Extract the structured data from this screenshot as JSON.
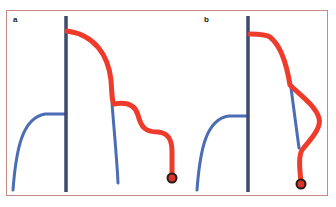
{
  "figure": {
    "panels": [
      {
        "label": "a",
        "description": "Main trunk with side branch; red trajectory descends past blue branch via S-curve to terminal endpoint"
      },
      {
        "label": "b",
        "description": "Main trunk with side branch; red trajectory bulges outward around blue branch and rejoins it before terminal endpoint"
      }
    ],
    "colors": {
      "trunk": "#3e4a6e",
      "branch": "#4a6db5",
      "path": "#ef3b2c",
      "endpoint_fill": "#d8352a",
      "endpoint_stroke": "#2a1a1a",
      "frame_border": "#c98a84"
    },
    "legend_items": []
  }
}
